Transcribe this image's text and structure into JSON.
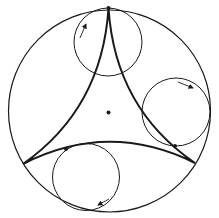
{
  "diagram": {
    "colors": {
      "background": "#ffffff",
      "stroke": "#1a1a1a"
    },
    "outer_circle": {
      "cx": 109.5,
      "cy": 111,
      "r": 101
    },
    "center_dot": {
      "cx": 108.5,
      "cy": 112.5,
      "r": 2
    },
    "cusps": [
      {
        "name": "top",
        "x": 108.5,
        "y": 8
      },
      {
        "name": "bottom-left",
        "x": 23,
        "y": 164
      },
      {
        "name": "bottom-right",
        "x": 195,
        "y": 163
      }
    ],
    "rolling_circles": [
      {
        "name": "top",
        "cx": 108,
        "cy": 42,
        "r": 34,
        "arrow": {
          "x1": 80,
          "y1": 38,
          "x2": 86,
          "y2": 24
        },
        "contact_dot": {
          "x": 108.5,
          "y": 8
        }
      },
      {
        "name": "right",
        "cx": 176,
        "cy": 112,
        "r": 34,
        "arrow": {
          "x1": 178,
          "y1": 82,
          "x2": 193,
          "y2": 88
        },
        "contact_dot": {
          "x": 175,
          "y": 146
        }
      },
      {
        "name": "bottom",
        "cx": 86,
        "cy": 177,
        "r": 33.5,
        "arrow": {
          "x1": 109,
          "y1": 199,
          "x2": 98,
          "y2": 205
        },
        "contact_dot": {
          "x": 66,
          "y": 149
        }
      }
    ]
  }
}
